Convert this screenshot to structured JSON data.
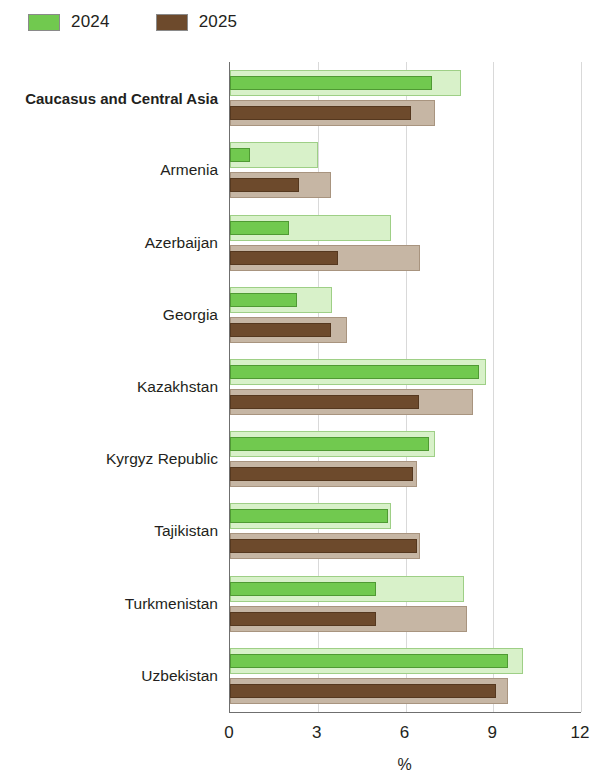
{
  "legend": {
    "items": [
      {
        "label": "2024",
        "color": "#71c94f"
      },
      {
        "label": "2025",
        "color": "#6d4a2c"
      }
    ]
  },
  "axis": {
    "xlabel": "%",
    "ticks": [
      "0",
      "3",
      "6",
      "9",
      "12"
    ]
  },
  "chart_data": {
    "type": "bar",
    "orientation": "horizontal",
    "title": "",
    "subtitle": "",
    "xlabel": "%",
    "ylabel": "",
    "xlim": [
      0,
      12
    ],
    "xticks": [
      0,
      3,
      6,
      9,
      12
    ],
    "grid": true,
    "legend_position": "top-left",
    "categories": [
      "Caucasus and Central Asia",
      "Armenia",
      "Azerbaijan",
      "Georgia",
      "Kazakhstan",
      "Kyrgyz Republic",
      "Tajikistan",
      "Turkmenistan",
      "Uzbekistan"
    ],
    "bold_categories": [
      "Caucasus and Central Asia"
    ],
    "series": [
      {
        "name": "2024",
        "color": "#71c94f",
        "band_color": "#d8f1c9",
        "values": [
          6.9,
          0.7,
          2.0,
          2.3,
          8.5,
          6.8,
          5.4,
          5.0,
          9.5
        ],
        "band_values": [
          7.9,
          3.0,
          5.5,
          3.5,
          8.75,
          7.0,
          5.5,
          8.0,
          10.0
        ]
      },
      {
        "name": "2025",
        "color": "#6d4a2c",
        "band_color": "#c6b6a4",
        "values": [
          6.2,
          2.35,
          3.7,
          3.45,
          6.45,
          6.25,
          6.4,
          5.0,
          9.1
        ],
        "band_values": [
          7.0,
          3.45,
          6.5,
          4.0,
          8.3,
          6.4,
          6.5,
          8.1,
          9.5
        ]
      }
    ]
  }
}
